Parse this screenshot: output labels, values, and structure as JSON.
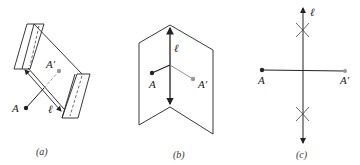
{
  "figure": {
    "panels": [
      {
        "id": "a",
        "caption": "(a)",
        "labels": {
          "point": "A",
          "image": "A′",
          "line": "ℓ"
        }
      },
      {
        "id": "b",
        "caption": "(b)",
        "labels": {
          "point": "A",
          "image": "A′",
          "line": "ℓ"
        }
      },
      {
        "id": "c",
        "caption": "(c)",
        "labels": {
          "point": "A",
          "image": "A′",
          "line": "ℓ"
        }
      }
    ],
    "colors": {
      "stroke": "#222222",
      "image_point": "#999999",
      "dashed": "#444444"
    }
  }
}
